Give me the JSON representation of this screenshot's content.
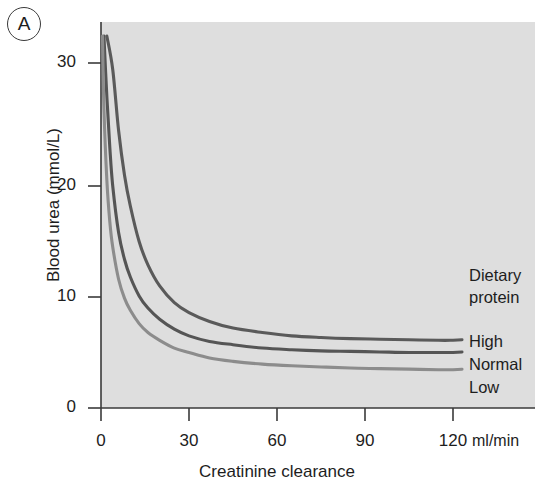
{
  "figure": {
    "panel_label": "A",
    "background_color": "#ffffff",
    "plot_background_color": "#dedede"
  },
  "chart_data": {
    "type": "line",
    "title": "",
    "xlabel": "Creatinine clearance",
    "x_unit": "ml/min",
    "ylabel": "Blood urea (mmol/L)",
    "xlim": [
      0,
      130
    ],
    "ylim": [
      0,
      33.5
    ],
    "xticks": [
      0,
      30,
      60,
      90,
      120
    ],
    "xtick_labels": [
      "0",
      "30",
      "60",
      "90",
      "120"
    ],
    "yticks": [
      0,
      10,
      20,
      30
    ],
    "ytick_labels": [
      "0",
      "10",
      "20",
      "30"
    ],
    "grid": false,
    "legend_position": "right-inside",
    "legend_title": [
      "Dietary",
      "protein"
    ],
    "series": [
      {
        "name": "High",
        "color": "#5a5a5a",
        "label_y_value": 6.2,
        "x": [
          2,
          4,
          6,
          8,
          10,
          13,
          16,
          20,
          25,
          30,
          37,
          45,
          55,
          65,
          75,
          85,
          95,
          105,
          115,
          120
        ],
        "y": [
          33.5,
          30.5,
          25.0,
          21.0,
          18.2,
          15.0,
          12.9,
          11.0,
          9.5,
          8.6,
          7.8,
          7.2,
          6.8,
          6.5,
          6.35,
          6.25,
          6.2,
          6.15,
          6.1,
          6.1
        ]
      },
      {
        "name": "Normal",
        "color": "#555555",
        "label_y_value": 5.0,
        "x": [
          1,
          2,
          3,
          4,
          6,
          8,
          10,
          13,
          16,
          20,
          25,
          30,
          37,
          45,
          55,
          65,
          75,
          85,
          95,
          105,
          115,
          120
        ],
        "y": [
          33.5,
          28.0,
          23.5,
          20.0,
          15.8,
          13.4,
          11.8,
          10.1,
          9.0,
          8.0,
          7.1,
          6.5,
          6.0,
          5.7,
          5.4,
          5.25,
          5.15,
          5.1,
          5.05,
          5.0,
          5.0,
          5.0
        ]
      },
      {
        "name": "Low",
        "color": "#8c8c8c",
        "label_y_value": 3.4,
        "x": [
          0.5,
          1,
          2,
          3,
          4,
          6,
          8,
          10,
          13,
          16,
          20,
          25,
          30,
          37,
          45,
          55,
          65,
          75,
          85,
          95,
          105,
          115,
          120
        ],
        "y": [
          33.5,
          27.0,
          20.5,
          16.8,
          14.5,
          11.6,
          9.9,
          8.8,
          7.6,
          6.8,
          6.1,
          5.4,
          5.0,
          4.5,
          4.2,
          3.95,
          3.8,
          3.7,
          3.6,
          3.55,
          3.5,
          3.45,
          3.45
        ]
      }
    ]
  },
  "legend": {
    "title_line1": "Dietary",
    "title_line2": "protein",
    "items": [
      {
        "label": "High"
      },
      {
        "label": "Normal"
      },
      {
        "label": "Low"
      }
    ]
  },
  "axes": {
    "y_title": "Blood urea (mmol/L)",
    "x_title": "Creatinine clearance",
    "x_unit": "ml/min",
    "y_tick_labels": [
      "30",
      "20",
      "10",
      "0"
    ],
    "x_tick_labels": [
      "0",
      "30",
      "60",
      "90",
      "120"
    ]
  }
}
